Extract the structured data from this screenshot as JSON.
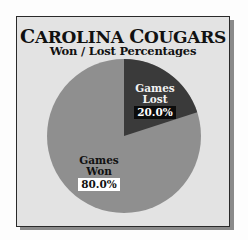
{
  "chart_data": {
    "type": "pie",
    "title": "CAROLINA COUGARS",
    "subtitle": "Won / Lost Percentages",
    "categories": [
      "Games Lost",
      "Games Won"
    ],
    "values": [
      20.0,
      80.0
    ],
    "value_labels": [
      "20.0%",
      "80.0%"
    ],
    "colors": [
      "#3a3a3a",
      "#8f8f8f"
    ],
    "start_angle_deg": 0,
    "direction": "clockwise",
    "legend": "none",
    "data_labels": "inside"
  },
  "card": {
    "background": "#e3e3e3",
    "border": "#2a2a2a",
    "shadow": "#8a8a8a"
  },
  "title": {
    "first_word_initial": "C",
    "first_word_rest": "AROLINA",
    "second_word_initial": "C",
    "second_word_rest": "OUGARS",
    "subtitle": "Won / Lost Percentages"
  },
  "slices": {
    "lost": {
      "line1": "Games",
      "line2": "Lost",
      "pct": "20.0%"
    },
    "won": {
      "line1": "Games",
      "line2": "Won",
      "pct": "80.0%"
    }
  }
}
